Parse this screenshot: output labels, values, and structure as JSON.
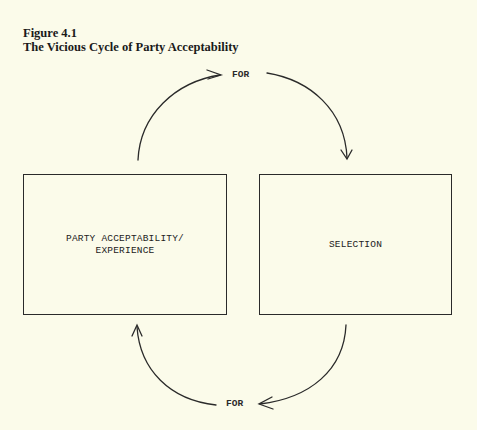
{
  "figure": {
    "number": "Figure 4.1",
    "title": "The Vicious Cycle of Party Acceptability"
  },
  "nodes": [
    {
      "id": "party-acceptability",
      "lines": [
        "PARTY ACCEPTABILITY/",
        "EXPERIENCE"
      ]
    },
    {
      "id": "selection",
      "lines": [
        "SELECTION"
      ]
    }
  ],
  "edges": [
    {
      "from": "party-acceptability",
      "to": "selection",
      "label": "FOR",
      "position": "top"
    },
    {
      "from": "selection",
      "to": "party-acceptability",
      "label": "FOR",
      "position": "bottom"
    }
  ],
  "colors": {
    "background": "#fbfbea",
    "ink": "#2a2a2a"
  }
}
